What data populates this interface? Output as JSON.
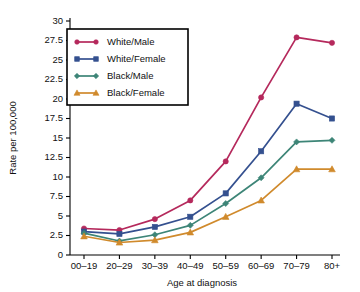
{
  "chart_data": {
    "type": "line",
    "title": "",
    "xlabel": "Age at diagnosis",
    "ylabel": "Rate per 100,000",
    "categories": [
      "00–19",
      "20–29",
      "30–39",
      "40–49",
      "50–59",
      "60–69",
      "70–79",
      "80+"
    ],
    "ylim": [
      0,
      30
    ],
    "yticks": [
      "0",
      "2.5",
      "5",
      "7.5",
      "10",
      "12.5",
      "15",
      "17.5",
      "20",
      "22.5",
      "25",
      "27.5",
      "30"
    ],
    "ytick_values": [
      0,
      2.5,
      5,
      7.5,
      10,
      12.5,
      15,
      17.5,
      20,
      22.5,
      25,
      27.5,
      30
    ],
    "grid": false,
    "legend_position": "upper-left",
    "series": [
      {
        "name": "White/Male",
        "color": "#b5295c",
        "marker": "circle",
        "values": [
          3.4,
          3.2,
          4.6,
          7.0,
          12.0,
          20.2,
          27.9,
          27.2
        ]
      },
      {
        "name": "White/Female",
        "color": "#34508f",
        "marker": "square",
        "values": [
          3.0,
          2.7,
          3.6,
          4.9,
          7.9,
          13.3,
          19.4,
          17.5
        ]
      },
      {
        "name": "Black/Male",
        "color": "#3d8577",
        "marker": "diamond",
        "values": [
          2.8,
          1.8,
          2.6,
          3.8,
          6.6,
          9.9,
          14.5,
          14.7
        ]
      },
      {
        "name": "Black/Female",
        "color": "#d08a2c",
        "marker": "triangle",
        "values": [
          2.4,
          1.6,
          1.9,
          2.9,
          4.9,
          7.0,
          11.0,
          11.0
        ]
      }
    ]
  },
  "edge_note": {
    "text": ""
  }
}
